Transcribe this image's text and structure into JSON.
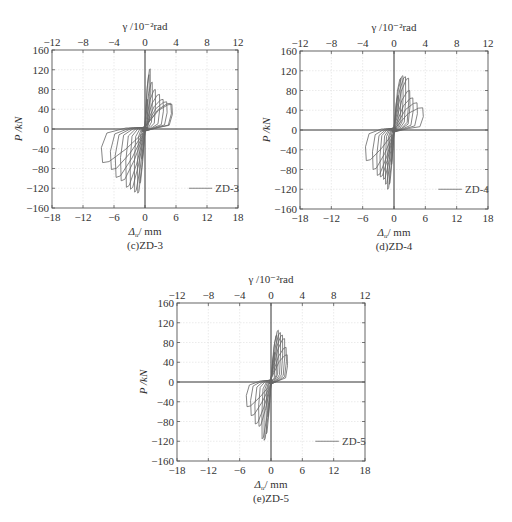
{
  "chart_data": [
    {
      "id": "zd3",
      "type": "line",
      "caption": "(c)ZD-3",
      "top_axis_label": "γ /10⁻²rad",
      "top_ticks": [
        "−12",
        "−8",
        "−4",
        "0",
        "4",
        "8",
        "12"
      ],
      "top_xlim": [
        -12,
        12
      ],
      "xlabel_symbol": "Δ",
      "xlabel_sub": "u",
      "xlabel_unit": "/ mm",
      "ylabel": "P /kN",
      "xlim": [
        -18,
        18
      ],
      "ylim": [
        -160,
        160
      ],
      "x_ticks": [
        "−18",
        "−12",
        "−6",
        "0",
        "6",
        "12",
        "18"
      ],
      "y_ticks": [
        "160",
        "120",
        "80",
        "40",
        "0",
        "−40",
        "−80",
        "−120",
        "−160"
      ],
      "grid": true,
      "legend": {
        "label": "ZD-3",
        "placement": "bottom-right"
      },
      "cycles": [
        {
          "pos_x": 0.5,
          "pos_p": 60,
          "neg_x": -0.6,
          "neg_p": -60
        },
        {
          "pos_x": 0.8,
          "pos_p": 110,
          "neg_x": -1.0,
          "neg_p": -110
        },
        {
          "pos_x": 1.0,
          "pos_p": 122,
          "neg_x": -1.4,
          "neg_p": -130
        },
        {
          "pos_x": 1.4,
          "pos_p": 95,
          "neg_x": -2.0,
          "neg_p": -128
        },
        {
          "pos_x": 2.0,
          "pos_p": 80,
          "neg_x": -2.8,
          "neg_p": -122
        },
        {
          "pos_x": 2.8,
          "pos_p": 70,
          "neg_x": -3.6,
          "neg_p": -118
        },
        {
          "pos_x": 3.5,
          "pos_p": 60,
          "neg_x": -4.6,
          "neg_p": -105
        },
        {
          "pos_x": 4.2,
          "pos_p": 55,
          "neg_x": -5.6,
          "neg_p": -98
        },
        {
          "pos_x": 5.0,
          "pos_p": 52,
          "neg_x": -6.5,
          "neg_p": -82
        },
        {
          "pos_x": 5.2,
          "pos_p": 50,
          "neg_x": -8.2,
          "neg_p": -68
        }
      ]
    },
    {
      "id": "zd4",
      "type": "line",
      "caption": "(d)ZD-4",
      "top_axis_label": "γ /10⁻²rad",
      "top_ticks": [
        "−12",
        "−8",
        "−4",
        "0",
        "4",
        "8",
        "12"
      ],
      "top_xlim": [
        -12,
        12
      ],
      "xlabel_symbol": "Δ",
      "xlabel_sub": "u",
      "xlabel_unit": "/ mm",
      "ylabel": "P /kN",
      "xlim": [
        -18,
        18
      ],
      "ylim": [
        -160,
        160
      ],
      "x_ticks": [
        "−18",
        "−12",
        "−6",
        "0",
        "6",
        "12",
        "18"
      ],
      "y_ticks": [
        "160",
        "120",
        "80",
        "40",
        "0",
        "−40",
        "−80",
        "−120",
        "−160"
      ],
      "grid": true,
      "legend": {
        "label": "ZD-4",
        "placement": "bottom-right"
      },
      "cycles": [
        {
          "pos_x": 0.8,
          "pos_p": 70,
          "neg_x": -0.5,
          "neg_p": -70
        },
        {
          "pos_x": 1.3,
          "pos_p": 105,
          "neg_x": -0.9,
          "neg_p": -110
        },
        {
          "pos_x": 1.7,
          "pos_p": 110,
          "neg_x": -1.2,
          "neg_p": -120
        },
        {
          "pos_x": 2.2,
          "pos_p": 108,
          "neg_x": -1.6,
          "neg_p": -110
        },
        {
          "pos_x": 2.8,
          "pos_p": 105,
          "neg_x": -2.0,
          "neg_p": -100
        },
        {
          "pos_x": 3.0,
          "pos_p": 80,
          "neg_x": -2.6,
          "neg_p": -95
        },
        {
          "pos_x": 3.6,
          "pos_p": 65,
          "neg_x": -3.2,
          "neg_p": -92
        },
        {
          "pos_x": 4.4,
          "pos_p": 55,
          "neg_x": -4.0,
          "neg_p": -80
        },
        {
          "pos_x": 5.5,
          "pos_p": 45,
          "neg_x": -5.3,
          "neg_p": -62
        }
      ]
    },
    {
      "id": "zd5",
      "type": "line",
      "caption": "(e)ZD-5",
      "top_axis_label": "γ /10⁻²rad",
      "top_ticks": [
        "−12",
        "−8",
        "−4",
        "0",
        "4",
        "8",
        "12"
      ],
      "top_xlim": [
        -12,
        12
      ],
      "xlabel_symbol": "Δ",
      "xlabel_sub": "u",
      "xlabel_unit": "/ mm",
      "ylabel": "P /kN",
      "xlim": [
        -18,
        18
      ],
      "ylim": [
        -160,
        160
      ],
      "x_ticks": [
        "−18",
        "−12",
        "−6",
        "0",
        "6",
        "12",
        "18"
      ],
      "y_ticks": [
        "160",
        "120",
        "80",
        "40",
        "0",
        "−40",
        "−80",
        "−120",
        "−160"
      ],
      "grid": true,
      "legend": {
        "label": "ZD-5",
        "placement": "bottom-right"
      },
      "cycles": [
        {
          "pos_x": 0.7,
          "pos_p": 60,
          "neg_x": -0.6,
          "neg_p": -70
        },
        {
          "pos_x": 1.1,
          "pos_p": 95,
          "neg_x": -0.9,
          "neg_p": -105
        },
        {
          "pos_x": 1.4,
          "pos_p": 105,
          "neg_x": -1.3,
          "neg_p": -118
        },
        {
          "pos_x": 1.8,
          "pos_p": 100,
          "neg_x": -1.7,
          "neg_p": -115
        },
        {
          "pos_x": 2.2,
          "pos_p": 95,
          "neg_x": -2.3,
          "neg_p": -90
        },
        {
          "pos_x": 2.6,
          "pos_p": 88,
          "neg_x": -3.0,
          "neg_p": -85
        },
        {
          "pos_x": 2.9,
          "pos_p": 70,
          "neg_x": -3.8,
          "neg_p": -68
        },
        {
          "pos_x": 3.1,
          "pos_p": 55,
          "neg_x": -4.6,
          "neg_p": -50
        }
      ]
    }
  ]
}
